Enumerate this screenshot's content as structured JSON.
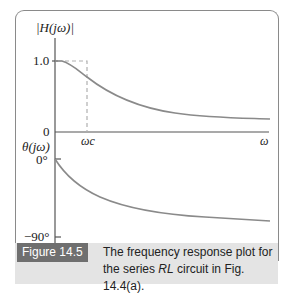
{
  "figure": {
    "tag": "Figure 14.5",
    "caption_part1": "The frequency response plot for the series ",
    "caption_italic": "RL",
    "caption_part2": " circuit in Fig. 14.4(a)."
  },
  "magnitude_plot": {
    "ylabel": "|H(jω)|",
    "ytick_top": "1.0",
    "ytick_bottom": "0",
    "xtick": "ωc",
    "xlabel": "ω"
  },
  "phase_plot": {
    "ylabel": "θ(jω)",
    "ytick_top": "0°",
    "ytick_bottom": "−90°"
  },
  "colors": {
    "curve": "#8a8a8a",
    "axis": "#555555",
    "dashed": "#b0b0b0",
    "caption_bg": "#e4e4e4",
    "tag_bg": "#6f6f6f"
  }
}
